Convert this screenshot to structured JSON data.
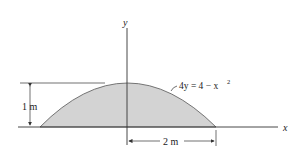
{
  "diagram": {
    "axis_x_label": "x",
    "axis_y_label": "y",
    "curve_equation_lhs": "4y = 4 − x",
    "curve_equation_exp": "2",
    "height_dimension": "1 m",
    "half_width_dimension": "2 m",
    "fill_color": "#d3d3d3",
    "stroke_color": "#333333"
  }
}
